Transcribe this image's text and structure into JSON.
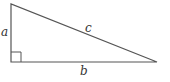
{
  "diagram": {
    "type": "right-triangle",
    "labels": {
      "a": "a",
      "b": "b",
      "c": "c"
    },
    "colors": {
      "stroke": "#555555",
      "text": "#333333",
      "background": "#ffffff"
    }
  }
}
